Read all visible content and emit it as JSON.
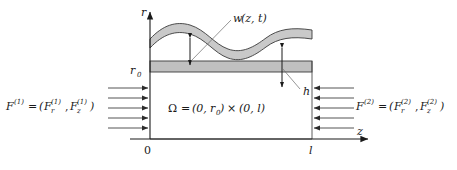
{
  "figure": {
    "type": "physics-schematic",
    "colors": {
      "band_fill": "#c9c9c9",
      "strip_fill": "#c0c0c0",
      "line": "#3a3a3a",
      "axis": "#1a1a1a",
      "text": "#1a1a1a",
      "background": "#ffffff"
    }
  },
  "axes": {
    "vertical_label": "r",
    "horizontal_label": "z",
    "origin_label": "0",
    "right_tick_label": "l",
    "top_tick_label": "r",
    "top_tick_sub": "0"
  },
  "labels": {
    "deflection": {
      "name": "w",
      "args": "(z, t)",
      "full": "w(z, t)"
    },
    "thickness": {
      "symbol": "h"
    },
    "domain": {
      "symbol": "Ω",
      "equals": "=",
      "interval_r_open": "(0,",
      "interval_r_sub": "0",
      "interval_r_close": ")",
      "times": "×",
      "interval_z": "(0, l)",
      "full": "Ω = (0, r0) × (0, l)"
    },
    "force_left": {
      "symbol": "F",
      "sup": "(1)",
      "equals": "=",
      "open": "(",
      "comp_r": "F",
      "comp_r_sub": "r",
      "comp_r_sup": "(1)",
      "comma": ",",
      "comp_z": "F",
      "comp_z_sub": "z",
      "comp_z_sup": "(1)",
      "close": ")",
      "full": "F(1) = (Fr(1), Fz(1))"
    },
    "force_right": {
      "symbol": "F",
      "sup": "(2)",
      "equals": "=",
      "open": "(",
      "comp_r": "F",
      "comp_r_sub": "r",
      "comp_r_sup": "(2)",
      "comma": ",",
      "comp_z": "F",
      "comp_z_sub": "z",
      "comp_z_sup": "(2)",
      "close": ")",
      "full": "F(2) = (Fr(2), Fz(2))"
    }
  },
  "arrows": {
    "left_count": 5,
    "left_direction": "right",
    "right_count": 5,
    "right_direction": "left"
  },
  "geometry": {
    "domain_left_x": 150,
    "domain_right_x": 312,
    "baseline_y": 139,
    "r0_y": 72,
    "strip_top_y": 61,
    "strip_bottom_y": 72
  }
}
